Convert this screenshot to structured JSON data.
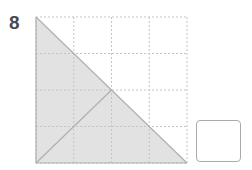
{
  "question": {
    "number": "8"
  },
  "figure": {
    "type": "grid-shading-puzzle",
    "grid": {
      "rows": 4,
      "cols": 4,
      "line_style": "dotted",
      "line_color": "#c8c8c8"
    },
    "shaded_fill": "#e2e2e2",
    "edge_color": "#b3b3b3",
    "shapes": [
      {
        "name": "large-right-triangle",
        "vertices": [
          [
            0,
            0
          ],
          [
            0,
            4
          ],
          [
            4,
            4
          ]
        ],
        "shaded": true
      },
      {
        "name": "inner-diagonal",
        "from": [
          0,
          4
        ],
        "to": [
          2,
          2
        ]
      }
    ]
  },
  "answer_box": {
    "value": ""
  }
}
